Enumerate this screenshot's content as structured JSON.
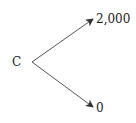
{
  "diagram": {
    "type": "binomial-tree",
    "root": {
      "label": "C"
    },
    "branches": [
      {
        "direction": "up",
        "label": "2,000"
      },
      {
        "direction": "down",
        "label": "0"
      }
    ],
    "colors": {
      "line": "#555555",
      "text": "#222222",
      "background": "#ffffff"
    }
  }
}
